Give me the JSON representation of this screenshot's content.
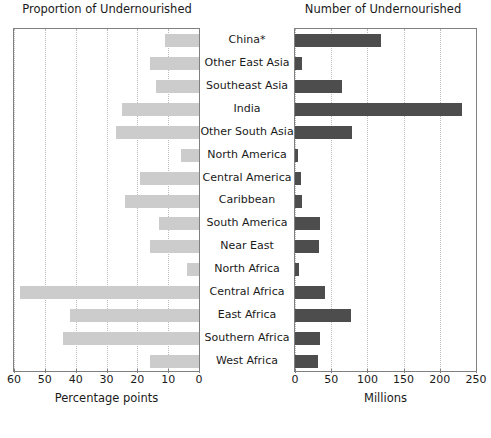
{
  "left_panel": {
    "title": "Proportion of Undernourished",
    "axis_label": "Percentage points",
    "ticks": [
      "60",
      "50",
      "40",
      "30",
      "20",
      "10",
      "0"
    ],
    "bar_color": "#cccccc"
  },
  "right_panel": {
    "title": "Number of Undernourished",
    "axis_label": "Millions",
    "ticks": [
      "0",
      "50",
      "100",
      "150",
      "200",
      "250"
    ],
    "bar_color": "#4d4d4d"
  },
  "chart_data": {
    "type": "bar",
    "title": "",
    "orientation": "horizontal",
    "layout": "back-to-back paired panels sharing centred category labels",
    "categories": [
      "China*",
      "Other East Asia",
      "Southeast Asia",
      "India",
      "Other South Asia",
      "North America",
      "Central America",
      "Caribbean",
      "South America",
      "Near East",
      "North Africa",
      "Central Africa",
      "East Africa",
      "Southern Africa",
      "West Africa"
    ],
    "series": [
      {
        "name": "Proportion of Undernourished",
        "panel": "left",
        "unit": "percentage points",
        "axis_direction": "reversed",
        "xlim": [
          60,
          0
        ],
        "xticks": [
          60,
          50,
          40,
          30,
          20,
          10,
          0
        ],
        "xlabel": "Percentage points",
        "color": "#cccccc",
        "values": [
          11,
          16,
          14,
          25,
          27,
          6,
          19,
          24,
          13,
          16,
          4,
          58,
          42,
          44,
          16
        ]
      },
      {
        "name": "Number of Undernourished",
        "panel": "right",
        "unit": "millions",
        "axis_direction": "normal",
        "xlim": [
          0,
          250
        ],
        "xticks": [
          0,
          50,
          100,
          150,
          200,
          250
        ],
        "xlabel": "Millions",
        "color": "#4d4d4d",
        "values": [
          119,
          10,
          65,
          231,
          79,
          4,
          8,
          10,
          35,
          33,
          5,
          42,
          78,
          35,
          32
        ]
      }
    ],
    "grid": {
      "vertical": true,
      "horizontal": false,
      "style": "dotted",
      "color": "#b9b9b9"
    },
    "legend": {
      "visible": false,
      "position": "none"
    }
  }
}
